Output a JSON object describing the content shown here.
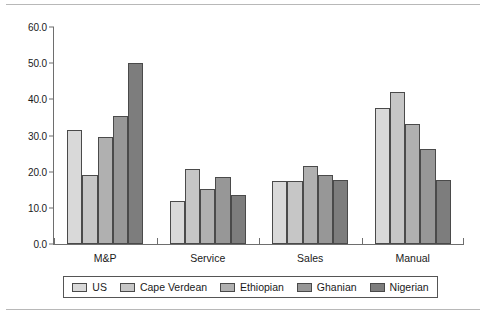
{
  "chart_data": {
    "type": "bar",
    "title": "",
    "subtitle": "",
    "xlabel": "",
    "ylabel": "",
    "categories": [
      "M&P",
      "Service",
      "Sales",
      "Manual"
    ],
    "series": [
      {
        "name": "US",
        "color": "#d9d9d9",
        "values": [
          31.5,
          12.0,
          17.5,
          37.5
        ]
      },
      {
        "name": "Cape Verdean",
        "color": "#c6c6c6",
        "values": [
          19.0,
          20.7,
          17.5,
          42.0
        ]
      },
      {
        "name": "Ethiopian",
        "color": "#b0b0b0",
        "values": [
          29.5,
          15.2,
          21.7,
          33.3
        ]
      },
      {
        "name": "Ghanian",
        "color": "#979797",
        "values": [
          35.5,
          18.5,
          19.2,
          26.2
        ]
      },
      {
        "name": "Nigerian",
        "color": "#7d7d7d",
        "values": [
          50.0,
          13.5,
          17.7,
          17.7
        ]
      }
    ],
    "ylim": [
      0.0,
      60.0
    ],
    "ytick_values": [
      0.0,
      10.0,
      20.0,
      30.0,
      40.0,
      50.0,
      60.0
    ],
    "ytick_labels": [
      "0.0",
      "10.0",
      "20.0",
      "30.0",
      "40.0",
      "50.0",
      "60.0"
    ],
    "grid": false,
    "legend_position": "bottom",
    "axis_color": "#6e6e6e",
    "bar_edge_color": "#4a4a4a",
    "background_color": "#ffffff"
  }
}
